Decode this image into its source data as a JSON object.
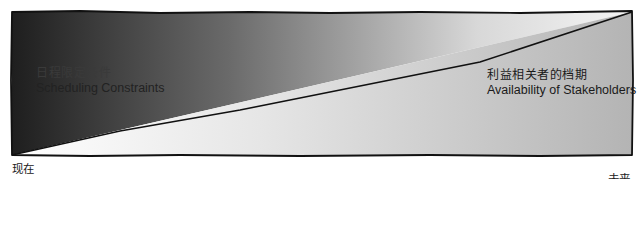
{
  "diagram": {
    "title": "",
    "regions": [
      {
        "id": "scheduling-constraints",
        "label_zh": "日程限定条件",
        "label_en": "Scheduling Constraints",
        "shape": "upper-left triangle",
        "gradient": {
          "from": "#1e1e1e",
          "to": "#f2f2f2",
          "direction": "left-to-right"
        }
      },
      {
        "id": "stakeholder-availability",
        "label_zh": "利益相关者的档期",
        "label_en": "Availability of Stakeholders",
        "shape": "lower-right triangle",
        "gradient": {
          "from": "#ffffff",
          "to": "#b4b4b4",
          "direction": "left-to-right"
        }
      }
    ],
    "axis": {
      "start_label": "现在",
      "end_label": "未来"
    },
    "colors": {
      "outline": "#111111",
      "background": "#ffffff"
    }
  }
}
